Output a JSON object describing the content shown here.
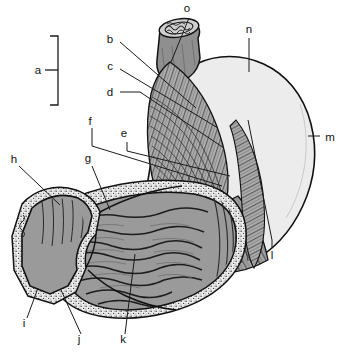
{
  "figure": {
    "type": "anatomical-illustration",
    "width": 340,
    "height": 353,
    "background_color": "#ffffff",
    "line_color": "#111111",
    "colors": {
      "outline": "#111111",
      "serosa_pale": "#ececec",
      "muscle_gray": "#a8a8a8",
      "mucosa_gray": "#9a9a9a",
      "lumen_mid": "#9f9f9f",
      "submucosa_stipple": "#e4e4e4",
      "esophagus_gray": "#8f8f8f",
      "label_text": "#111111"
    }
  },
  "labels": [
    {
      "id": "a",
      "text": "a",
      "x": 38,
      "y": 72,
      "style": "bracket",
      "bracket": {
        "x": 58,
        "y_top": 36,
        "y_bottom": 105,
        "tick_x_start": 45,
        "tick_x_end": 58,
        "tick_y": 70
      }
    },
    {
      "id": "b",
      "text": "b",
      "x": 110,
      "y": 39,
      "style": "leader"
    },
    {
      "id": "c",
      "text": "c",
      "x": 110,
      "y": 66,
      "style": "leader"
    },
    {
      "id": "d",
      "text": "d",
      "x": 110,
      "y": 95,
      "style": "leader"
    },
    {
      "id": "e",
      "text": "e",
      "x": 124,
      "y": 137,
      "style": "leader"
    },
    {
      "id": "f",
      "text": "f",
      "x": 90,
      "y": 125,
      "style": "leader"
    },
    {
      "id": "g",
      "text": "g",
      "x": 86,
      "y": 162,
      "style": "leader"
    },
    {
      "id": "h",
      "text": "h",
      "x": 13,
      "y": 162,
      "style": "leader"
    },
    {
      "id": "i",
      "text": "i",
      "x": 24,
      "y": 325,
      "style": "leader"
    },
    {
      "id": "j",
      "text": "j",
      "x": 78,
      "y": 341,
      "style": "leader"
    },
    {
      "id": "k",
      "text": "k",
      "x": 122,
      "y": 341,
      "style": "leader"
    },
    {
      "id": "l",
      "text": "l",
      "x": 272,
      "y": 257,
      "style": "leader"
    },
    {
      "id": "m",
      "text": "m",
      "x": 329,
      "y": 140,
      "style": "tick"
    },
    {
      "id": "n",
      "text": "n",
      "x": 246,
      "y": 32,
      "style": "tick"
    },
    {
      "id": "o",
      "text": "o",
      "x": 186,
      "y": 11,
      "style": "leader"
    }
  ],
  "leader_lines": [
    {
      "id": "b",
      "points": "120,42 196,108"
    },
    {
      "id": "c",
      "points": "120,69 218,128"
    },
    {
      "id": "d",
      "points": "120,92 140,92 224,148"
    },
    {
      "id": "e",
      "points": "127,142 127,151 230,176"
    },
    {
      "id": "f",
      "points": "92,128 92,146 222,186"
    },
    {
      "id": "g",
      "points": "92,166 110,210"
    },
    {
      "id": "h",
      "points": "19,166 60,205"
    },
    {
      "id": "i",
      "points": "27,318 38,288"
    },
    {
      "id": "j",
      "points": "81,334 61,290"
    },
    {
      "id": "k",
      "points": "125,334 135,254"
    },
    {
      "id": "l",
      "points": "272,248 272,240 248,120"
    },
    {
      "id": "m",
      "points": "308,136 320,136"
    },
    {
      "id": "n",
      "points": "249,38 249,72"
    },
    {
      "id": "o",
      "points": "189,18 171,62"
    }
  ],
  "structures": [
    {
      "name": "esophagus-cut-end",
      "region": "top-center",
      "shading": "gray-cylinder-with-wavy-lumen"
    },
    {
      "name": "muscularis-striations",
      "region": "upper-center",
      "shading": "fine-parallel-fiber-lines"
    },
    {
      "name": "fundus-body-serosa",
      "region": "right",
      "shading": "pale-outer-wall"
    },
    {
      "name": "gastric-rugae",
      "region": "lower-center",
      "shading": "wavy-mucosal-folds"
    },
    {
      "name": "pylorus-duodenum",
      "region": "lower-left",
      "shading": "sectioned-wall-with-stipple"
    },
    {
      "name": "submucosa-stipple",
      "region": "wall-lining",
      "shading": "dotted-band"
    }
  ]
}
